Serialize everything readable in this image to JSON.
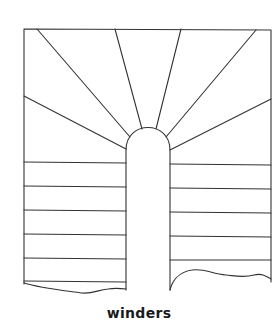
{
  "diagram": {
    "type": "stair-plan",
    "caption": "winders",
    "stroke_color": "#333333",
    "background": "#ffffff",
    "outline": {
      "left_x": 24,
      "right_x": 271,
      "top_y": 29
    },
    "newel": {
      "left_x": 126,
      "right_x": 170,
      "arch_top_y": 128,
      "straight_start_y": 150
    },
    "winder_rays": [
      {
        "from": [
          126,
          149
        ],
        "to": [
          24,
          96
        ]
      },
      {
        "from": [
          130,
          137
        ],
        "to": [
          37,
          29
        ]
      },
      {
        "from": [
          142,
          129
        ],
        "to": [
          115,
          29
        ]
      },
      {
        "from": [
          156,
          129
        ],
        "to": [
          181,
          29
        ]
      },
      {
        "from": [
          166,
          137
        ],
        "to": [
          256,
          30
        ]
      },
      {
        "from": [
          170,
          150
        ],
        "to": [
          271,
          99
        ]
      }
    ],
    "left_flight_treads_y": [
      162,
      186,
      210,
      234,
      258,
      281
    ],
    "right_flight_treads_y": [
      164,
      188,
      212,
      236,
      260
    ]
  }
}
